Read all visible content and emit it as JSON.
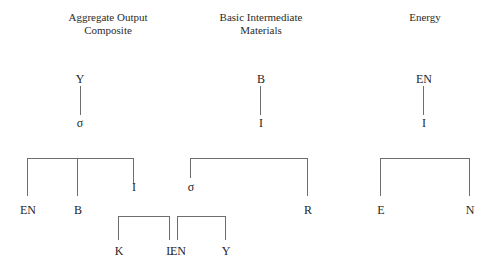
{
  "diagram": {
    "type": "tree-diagram",
    "background_color": "#ffffff",
    "line_color": "#6e6e6e",
    "text_color": "#262626",
    "columns": [
      {
        "id": "aggregate-output-composite",
        "title": "Aggregate Output\nComposite"
      },
      {
        "id": "basic-intermediate-materials",
        "title": "Basic Intermediate\nMaterials"
      },
      {
        "id": "energy",
        "title": "Energy"
      }
    ],
    "top_trees": [
      {
        "id": "tree-y-sigma",
        "root": "Y",
        "child": "σ"
      },
      {
        "id": "tree-b-i",
        "root": "B",
        "child": "I"
      },
      {
        "id": "tree-en-i",
        "root": "EN",
        "child": "I"
      }
    ],
    "bracket_groups": [
      {
        "id": "bracket-aggregate",
        "children": [
          {
            "id": "node-en-1",
            "label": "EN"
          },
          {
            "id": "node-b-1",
            "label": "B"
          },
          {
            "id": "node-i-1",
            "label": "I"
          }
        ]
      },
      {
        "id": "bracket-basic",
        "children": [
          {
            "id": "node-sigma-2",
            "label": "σ"
          },
          {
            "id": "node-r-2",
            "label": "R"
          }
        ]
      },
      {
        "id": "bracket-energy",
        "children": [
          {
            "id": "node-e-3",
            "label": "E"
          },
          {
            "id": "node-n-3",
            "label": "N"
          }
        ]
      }
    ],
    "sub_bracket_groups": [
      {
        "id": "bracket-kl",
        "children": [
          {
            "id": "node-k",
            "label": "K"
          },
          {
            "id": "node-l",
            "label": "L"
          }
        ]
      },
      {
        "id": "bracket-eny",
        "children": [
          {
            "id": "node-en-sub",
            "label": "EN"
          },
          {
            "id": "node-y-sub",
            "label": "Y"
          }
        ]
      }
    ]
  }
}
